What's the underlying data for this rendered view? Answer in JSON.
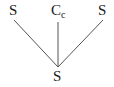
{
  "tree": {
    "root": {
      "label": "S"
    },
    "children": [
      {
        "label": "S",
        "subscript": ""
      },
      {
        "label": "C",
        "subscript": "c"
      },
      {
        "label": "S",
        "subscript": ""
      }
    ]
  },
  "colors": {
    "line": "#555555",
    "text": "#1a1a1a"
  }
}
